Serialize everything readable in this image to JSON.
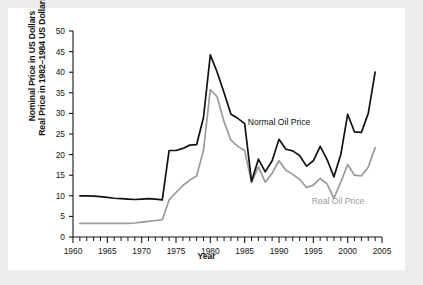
{
  "figure": {
    "background": "#ffffff",
    "page_background": "#ececed",
    "xlabel": "Year",
    "ylabel_line1": "Nominal Price in US Dollars",
    "ylabel_line2": "Real Price in 1982–1984 US Dollars"
  },
  "labels": {
    "nominal": "Normal Oil Price",
    "real": "Real Oil Price"
  },
  "colors": {
    "nominal": "#111111",
    "real": "#9a9a9a",
    "axis": "#161616",
    "text": "#161616"
  },
  "ticks": {
    "y": [
      "0",
      "5",
      "10",
      "15",
      "20",
      "25",
      "30",
      "35",
      "40",
      "45",
      "50"
    ],
    "x": [
      "1960",
      "1965",
      "1970",
      "1975",
      "1980",
      "1985",
      "1990",
      "1995",
      "2000",
      "2005"
    ]
  },
  "chart_data": {
    "type": "line",
    "title": "",
    "xlabel": "Year",
    "ylabel": "Nominal Price in US Dollars / Real Price in 1982–1984 US Dollars",
    "xlim": [
      1960,
      2005
    ],
    "ylim": [
      0,
      50
    ],
    "ytick_step": 5,
    "xtick_step": 5,
    "xminor_step": 1,
    "grid": false,
    "legend": "inline-annotations",
    "x": [
      1961,
      1962,
      1963,
      1964,
      1965,
      1966,
      1967,
      1968,
      1969,
      1970,
      1971,
      1972,
      1973,
      1974,
      1975,
      1976,
      1977,
      1978,
      1979,
      1980,
      1981,
      1982,
      1983,
      1984,
      1985,
      1986,
      1987,
      1988,
      1989,
      1990,
      1991,
      1992,
      1993,
      1994,
      1995,
      1996,
      1997,
      1998,
      1999,
      2000,
      2001,
      2002,
      2003,
      2004
    ],
    "series": [
      {
        "name": "Normal Oil Price",
        "color": "#111111",
        "label_x": 1990,
        "label_y": 27.2,
        "values": [
          10.0,
          10.0,
          9.9,
          9.8,
          9.6,
          9.4,
          9.3,
          9.2,
          9.1,
          9.2,
          9.3,
          9.2,
          9.0,
          21.0,
          21.0,
          21.5,
          22.3,
          22.4,
          29.0,
          44.2,
          40.0,
          35.0,
          29.8,
          28.8,
          27.5,
          13.5,
          18.9,
          15.8,
          18.5,
          23.7,
          21.3,
          20.9,
          19.8,
          17.2,
          18.5,
          22.0,
          18.8,
          14.6,
          20.0,
          29.8,
          25.5,
          25.4,
          30.0,
          40.0
        ]
      },
      {
        "name": "Real Oil Price",
        "color": "#9a9a9a",
        "label_x": 1998.6,
        "label_y": 8.0,
        "values": [
          3.3,
          3.3,
          3.3,
          3.3,
          3.3,
          3.3,
          3.3,
          3.3,
          3.4,
          3.6,
          3.8,
          4.0,
          4.2,
          9.0,
          10.8,
          12.5,
          13.8,
          14.8,
          21.0,
          35.8,
          34.0,
          28.0,
          23.5,
          22.0,
          21.0,
          13.3,
          17.0,
          13.3,
          15.5,
          18.5,
          16.2,
          15.2,
          14.0,
          12.0,
          12.6,
          14.2,
          12.9,
          9.4,
          13.3,
          17.6,
          15.0,
          14.8,
          17.0,
          21.7
        ]
      }
    ]
  }
}
